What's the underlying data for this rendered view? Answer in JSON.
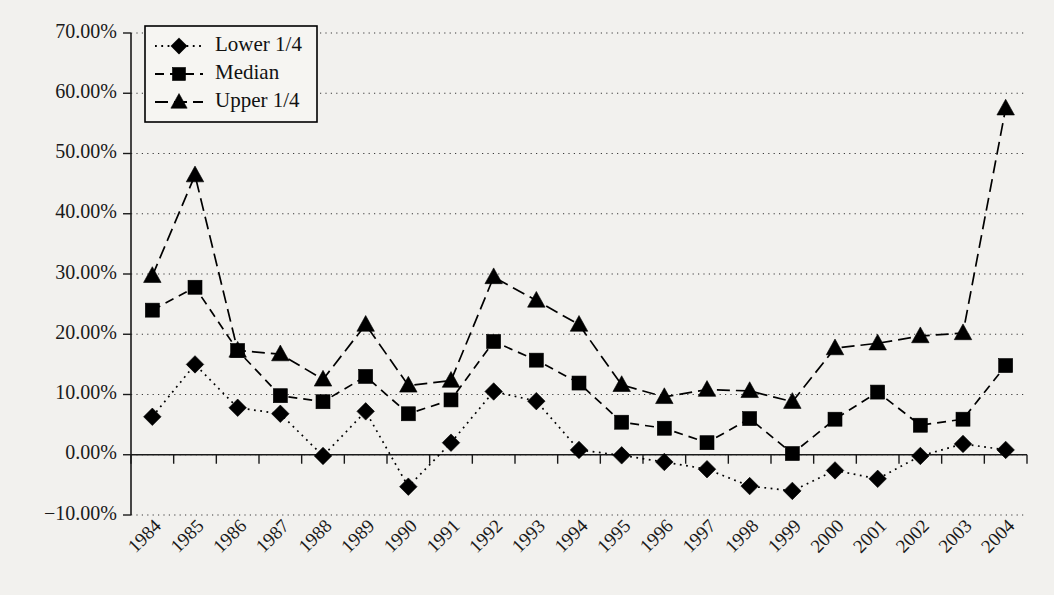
{
  "chart_data": {
    "type": "line",
    "title": "",
    "xlabel": "",
    "ylabel": "",
    "grid": true,
    "legend_position": "top-left",
    "ylim": [
      -10,
      70
    ],
    "ytick_format": "percent",
    "yticks": [
      -10,
      0,
      10,
      20,
      30,
      40,
      50,
      60,
      70
    ],
    "ytick_labels": [
      "−10.00%",
      "0.00%",
      "10.00%",
      "20.00%",
      "30.00%",
      "40.00%",
      "50.00%",
      "60.00%",
      "70.00%"
    ],
    "categories": [
      "1984",
      "1985",
      "1986",
      "1987",
      "1988",
      "1989",
      "1990",
      "1991",
      "1992",
      "1993",
      "1994",
      "1995",
      "1996",
      "1997",
      "1998",
      "1999",
      "2000",
      "2001",
      "2002",
      "2003",
      "2004"
    ],
    "series": [
      {
        "name": "Lower 1/4",
        "marker": "diamond",
        "dash": "dotted",
        "values": [
          6.3,
          15.0,
          7.8,
          6.8,
          -0.2,
          7.2,
          -5.3,
          2.0,
          10.5,
          8.9,
          0.8,
          -0.1,
          -1.2,
          -2.4,
          -5.2,
          -6.0,
          -2.6,
          -4.0,
          -0.2,
          1.8,
          0.8
        ]
      },
      {
        "name": "Median",
        "marker": "square",
        "dash": "dashed",
        "values": [
          24.0,
          27.8,
          17.3,
          9.8,
          8.8,
          13.0,
          6.8,
          9.1,
          18.8,
          15.7,
          11.9,
          5.4,
          4.4,
          2.0,
          6.0,
          0.2,
          5.9,
          10.4,
          4.9,
          5.9,
          14.8
        ]
      },
      {
        "name": "Upper 1/4",
        "marker": "triangle",
        "dash": "longdash",
        "values": [
          29.7,
          46.4,
          17.3,
          16.7,
          12.5,
          21.6,
          11.5,
          12.3,
          29.5,
          25.6,
          21.6,
          11.6,
          9.6,
          10.8,
          10.6,
          8.8,
          17.7,
          18.5,
          19.7,
          20.2,
          57.5
        ]
      }
    ]
  },
  "legend": {
    "entries": [
      {
        "label": "Lower 1/4"
      },
      {
        "label": "Median"
      },
      {
        "label": "Upper 1/4"
      }
    ]
  },
  "colors": {
    "background": "#f2f1ee",
    "ink": "#000000",
    "grid": "#3a3a3a"
  }
}
